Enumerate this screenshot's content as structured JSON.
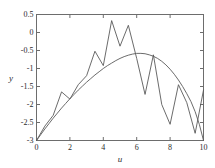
{
  "chart_data": {
    "type": "line",
    "title": "",
    "subtitle": "",
    "xlabel": "u",
    "ylabel": "y",
    "xlim": [
      0,
      10
    ],
    "ylim": [
      -3,
      0.5
    ],
    "xticks": [
      0,
      2,
      4,
      6,
      8,
      10
    ],
    "xticklabels": [
      "0",
      "2",
      "4",
      "6",
      "8",
      "10"
    ],
    "yticks": [
      0.5,
      0,
      -0.5,
      -1,
      -1.5,
      -2,
      -2.5,
      -3
    ],
    "yticklabels": [
      "0.5",
      "0",
      "-0.5",
      "-1",
      "-1.5",
      "-2",
      "-2.5",
      "-3"
    ],
    "grid": false,
    "legend": null,
    "legend_position": "none",
    "line_color": "#5a5a5a",
    "frame_color": "#6d6d6d",
    "background": "#ffffff",
    "series": [
      {
        "name": "smooth-fit",
        "style": "solid",
        "x": [
          0.0,
          0.25,
          0.5,
          0.75,
          1.0,
          1.25,
          1.5,
          1.75,
          2.0,
          2.25,
          2.5,
          2.75,
          3.0,
          3.25,
          3.5,
          3.75,
          4.0,
          4.25,
          4.5,
          4.75,
          5.0,
          5.25,
          5.5,
          5.75,
          6.0,
          6.25,
          6.5,
          6.75,
          7.0,
          7.25,
          7.5,
          7.75,
          8.0,
          8.25,
          8.5,
          8.75,
          9.0,
          9.25,
          9.5,
          9.75,
          10.0
        ],
        "y": [
          -3.0,
          -2.84,
          -2.68,
          -2.53,
          -2.38,
          -2.24,
          -2.1,
          -1.97,
          -1.84,
          -1.72,
          -1.6,
          -1.49,
          -1.38,
          -1.28,
          -1.18,
          -1.09,
          -1.0,
          -0.92,
          -0.85,
          -0.78,
          -0.72,
          -0.67,
          -0.63,
          -0.6,
          -0.58,
          -0.58,
          -0.59,
          -0.62,
          -0.66,
          -0.72,
          -0.8,
          -0.9,
          -1.02,
          -1.16,
          -1.32,
          -1.5,
          -1.7,
          -1.92,
          -2.2,
          -2.55,
          -3.0
        ]
      },
      {
        "name": "noisy-data",
        "style": "solid",
        "x": [
          0.0,
          0.5,
          1.0,
          1.5,
          2.0,
          2.5,
          3.0,
          3.5,
          4.0,
          4.5,
          5.0,
          5.5,
          6.0,
          6.5,
          7.0,
          7.5,
          8.0,
          8.5,
          9.0,
          9.5,
          10.0
        ],
        "y": [
          -3.0,
          -2.6,
          -2.3,
          -1.65,
          -1.85,
          -1.45,
          -1.2,
          -0.52,
          -0.92,
          0.33,
          -0.38,
          0.2,
          -0.72,
          -1.72,
          -0.62,
          -2.0,
          -2.55,
          -1.45,
          -1.95,
          -2.8,
          -1.6
        ]
      }
    ]
  },
  "axes": {
    "x_label": "u",
    "y_label": "y"
  }
}
